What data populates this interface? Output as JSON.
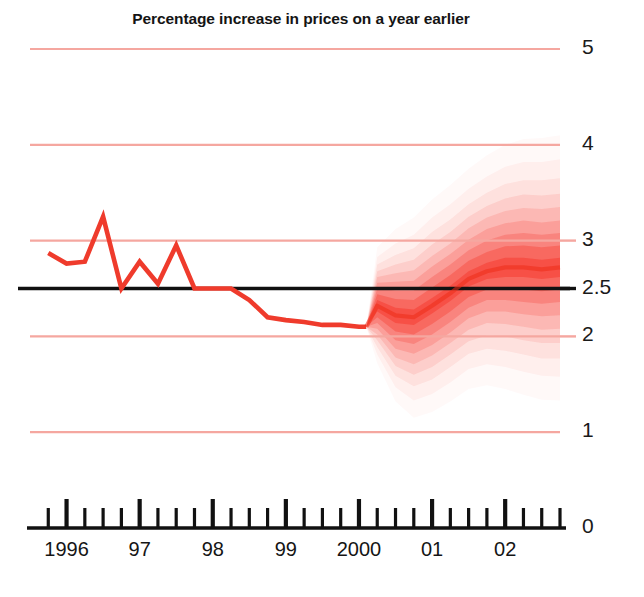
{
  "chart": {
    "title": "Percentage increase in prices on a year earlier",
    "type": "fan-chart"
  },
  "chart_data": {
    "type": "area",
    "title": "Percentage increase in prices on a year earlier",
    "xlabel": "",
    "ylabel": "",
    "ylim": [
      0,
      5
    ],
    "yticks": [
      0,
      1,
      2,
      2.5,
      3,
      4,
      5
    ],
    "ytick_labels": [
      "0",
      "1",
      "2",
      "2.5",
      "3",
      "4",
      "5"
    ],
    "gridlines": [
      1,
      2,
      3,
      4,
      5
    ],
    "target_line": 2.5,
    "grid": true,
    "legend": null,
    "xlim": [
      1995.5,
      2002.75
    ],
    "xticks": [
      1996,
      1997,
      1998,
      1999,
      2000,
      2001,
      2002
    ],
    "xtick_labels": [
      "1996",
      "97",
      "98",
      "99",
      "2000",
      "01",
      "02"
    ],
    "minor_tick_interval_years": 0.25,
    "series": [
      {
        "name": "Historical inflation (RPIX)",
        "kind": "line",
        "color": "#ef3b2c",
        "x": [
          1995.75,
          1996.0,
          1996.25,
          1996.5,
          1996.75,
          1997.0,
          1997.25,
          1997.5,
          1997.75,
          1998.0,
          1998.25,
          1998.5,
          1998.75,
          1999.0,
          1999.25,
          1999.5,
          1999.75,
          2000.0,
          2000.1
        ],
        "values": [
          2.87,
          2.76,
          2.78,
          3.25,
          2.5,
          2.78,
          2.55,
          2.95,
          2.5,
          2.5,
          2.5,
          2.38,
          2.2,
          2.17,
          2.15,
          2.12,
          2.12,
          2.1,
          2.1
        ]
      },
      {
        "name": "Central projection (mode)",
        "kind": "line",
        "color": "#ee2b18",
        "x": [
          2000.1,
          2000.25,
          2000.5,
          2000.75,
          2001.0,
          2001.25,
          2001.5,
          2001.75,
          2002.0,
          2002.25,
          2002.5,
          2002.75
        ],
        "values": [
          2.1,
          2.32,
          2.22,
          2.2,
          2.32,
          2.45,
          2.6,
          2.68,
          2.72,
          2.72,
          2.7,
          2.72
        ]
      }
    ],
    "fan_bands": [
      {
        "probability": 10,
        "opacity": 1.0,
        "lower": [
          2.1,
          2.26,
          2.14,
          2.12,
          2.24,
          2.37,
          2.52,
          2.6,
          2.62,
          2.62,
          2.6,
          2.62
        ],
        "upper": [
          2.1,
          2.38,
          2.3,
          2.28,
          2.4,
          2.53,
          2.68,
          2.77,
          2.82,
          2.82,
          2.8,
          2.82
        ]
      },
      {
        "probability": 20,
        "opacity": 0.82,
        "lower": [
          2.1,
          2.2,
          2.05,
          2.02,
          2.13,
          2.26,
          2.41,
          2.49,
          2.5,
          2.49,
          2.47,
          2.49
        ],
        "upper": [
          2.1,
          2.44,
          2.39,
          2.38,
          2.51,
          2.64,
          2.79,
          2.88,
          2.94,
          2.95,
          2.93,
          2.95
        ]
      },
      {
        "probability": 30,
        "opacity": 0.64,
        "lower": [
          2.1,
          2.14,
          1.96,
          1.92,
          2.02,
          2.15,
          2.3,
          2.38,
          2.38,
          2.36,
          2.34,
          2.36
        ],
        "upper": [
          2.1,
          2.5,
          2.48,
          2.48,
          2.62,
          2.75,
          2.9,
          3.0,
          3.06,
          3.08,
          3.06,
          3.08
        ]
      },
      {
        "probability": 40,
        "opacity": 0.5,
        "lower": [
          2.1,
          2.08,
          1.87,
          1.82,
          1.91,
          2.04,
          2.19,
          2.26,
          2.26,
          2.23,
          2.21,
          2.22
        ],
        "upper": [
          2.1,
          2.56,
          2.57,
          2.58,
          2.73,
          2.86,
          3.01,
          3.12,
          3.18,
          3.21,
          3.19,
          3.21
        ]
      },
      {
        "probability": 50,
        "opacity": 0.39,
        "lower": [
          2.1,
          2.02,
          1.78,
          1.71,
          1.8,
          1.93,
          2.07,
          2.14,
          2.13,
          2.1,
          2.07,
          2.08
        ],
        "upper": [
          2.1,
          2.62,
          2.66,
          2.69,
          2.84,
          2.97,
          3.13,
          3.24,
          3.31,
          3.34,
          3.33,
          3.35
        ]
      },
      {
        "probability": 60,
        "opacity": 0.3,
        "lower": [
          2.1,
          1.96,
          1.69,
          1.6,
          1.68,
          1.81,
          1.95,
          2.01,
          2.0,
          1.96,
          1.93,
          1.93
        ],
        "upper": [
          2.1,
          2.68,
          2.75,
          2.8,
          2.96,
          3.09,
          3.25,
          3.36,
          3.44,
          3.48,
          3.47,
          3.49
        ]
      },
      {
        "probability": 70,
        "opacity": 0.22,
        "lower": [
          2.1,
          1.89,
          1.59,
          1.48,
          1.55,
          1.68,
          1.82,
          1.87,
          1.85,
          1.81,
          1.77,
          1.77
        ],
        "upper": [
          2.1,
          2.75,
          2.85,
          2.92,
          3.09,
          3.22,
          3.38,
          3.5,
          3.59,
          3.63,
          3.63,
          3.65
        ]
      },
      {
        "probability": 80,
        "opacity": 0.15,
        "lower": [
          2.1,
          1.81,
          1.47,
          1.33,
          1.4,
          1.52,
          1.66,
          1.71,
          1.68,
          1.63,
          1.59,
          1.58
        ],
        "upper": [
          2.1,
          2.83,
          2.97,
          3.06,
          3.24,
          3.38,
          3.54,
          3.67,
          3.77,
          3.82,
          3.82,
          3.85
        ]
      },
      {
        "probability": 90,
        "opacity": 0.09,
        "lower": [
          2.1,
          1.72,
          1.32,
          1.15,
          1.21,
          1.32,
          1.45,
          1.49,
          1.45,
          1.39,
          1.34,
          1.33
        ],
        "upper": [
          2.1,
          2.93,
          3.12,
          3.24,
          3.43,
          3.58,
          3.75,
          3.89,
          4.0,
          4.06,
          4.07,
          4.1
        ]
      }
    ],
    "colors": {
      "line": "#ef3b2c",
      "fan": "#f5170a",
      "gridline": "#f5a7a0",
      "target": "#111111",
      "axis": "#111111",
      "text": "#141414"
    }
  },
  "axis_labels": {
    "y": [
      {
        "text": "5",
        "value": 5
      },
      {
        "text": "4",
        "value": 4
      },
      {
        "text": "3",
        "value": 3
      },
      {
        "text": "2.5",
        "value": 2.5
      },
      {
        "text": "2",
        "value": 2
      },
      {
        "text": "1",
        "value": 1
      },
      {
        "text": "0",
        "value": 0
      }
    ],
    "x": [
      {
        "text": "1996",
        "value": 1996
      },
      {
        "text": "97",
        "value": 1997
      },
      {
        "text": "98",
        "value": 1998
      },
      {
        "text": "99",
        "value": 1999
      },
      {
        "text": "2000",
        "value": 2000
      },
      {
        "text": "01",
        "value": 2001
      },
      {
        "text": "02",
        "value": 2002
      }
    ]
  }
}
